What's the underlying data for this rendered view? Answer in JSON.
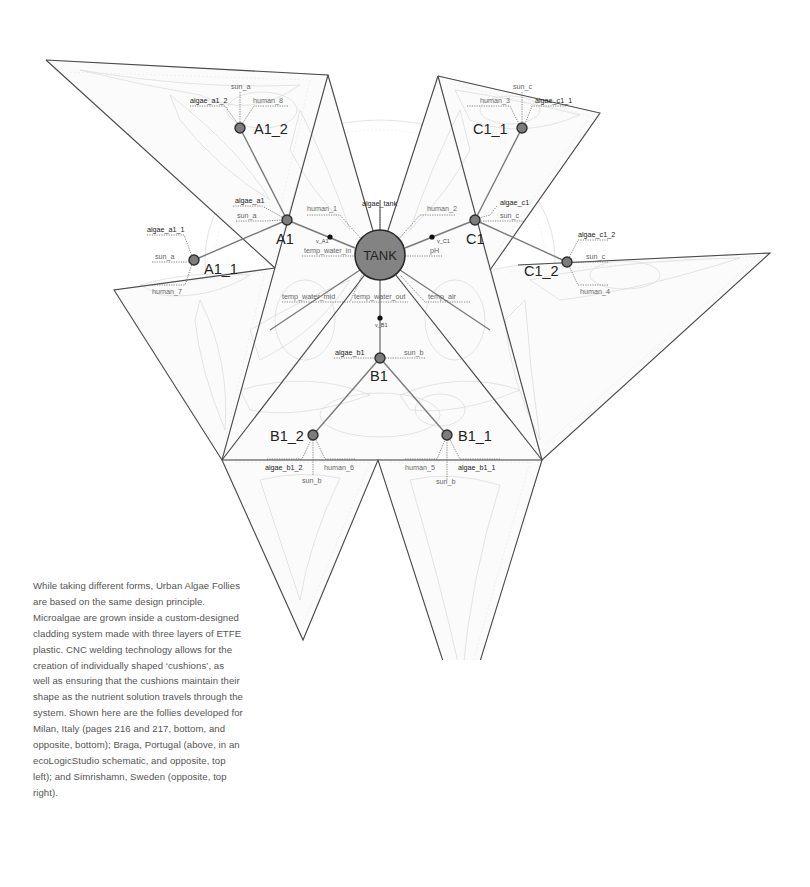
{
  "diagram": {
    "colors": {
      "node_fill": "#7c7c7c",
      "tank_fill": "#838383",
      "edge": "#4a4a4a",
      "background": "#ffffff"
    },
    "tank": {
      "label": "TANK"
    },
    "nodes": {
      "A1": "A1",
      "A1_1": "A1_1",
      "A1_2": "A1_2",
      "B1": "B1",
      "B1_1": "B1_1",
      "B1_2": "B1_2",
      "C1": "C1",
      "C1_1": "C1_1",
      "C1_2": "C1_2"
    },
    "valves": {
      "v_A1": "v_A1",
      "v_B1": "v_B1",
      "v_C1": "v_C1"
    },
    "sensors": {
      "algae_tank": "algae_tank",
      "human_1": "human_1",
      "human_2": "human_2",
      "temp_water_in": "temp_water_in",
      "pH": "pH",
      "temp_water_mid": "temp_water_mid",
      "temp_water_out": "temp_water_out",
      "temp_air": "temp_air",
      "algae_a1": "algae_a1",
      "sun_a_a1": "sun_a",
      "algae_a1_1": "algae_a1_1",
      "sun_a_a1_1": "sun_a",
      "human_7": "human_7",
      "algae_a1_2": "algae_a1_2",
      "sun_a_a1_2": "sun_a",
      "human_8": "human_8",
      "algae_c1": "algae_c1",
      "sun_c_c1": "sun_c",
      "algae_c1_1": "algae_c1_1",
      "sun_c_c1_1": "sun_c",
      "human_3": "human_3",
      "algae_c1_2": "algae_c1_2",
      "sun_c_c1_2": "sun_c",
      "human_4": "human_4",
      "algae_b1": "algae_b1",
      "sun_b_b1": "sun_b",
      "algae_b1_1": "algae_b1_1",
      "sun_b_b1_1": "sun_b",
      "human_5": "human_5",
      "algae_b1_2": "algae_b1_2",
      "sun_b_b1_2": "sun_b",
      "human_6": "human_6"
    }
  },
  "caption": {
    "text": "While taking different forms, Urban Algae Follies are based on the same design principle. Microalgae are grown inside a custom-designed cladding system made with three layers of ETFE plastic. CNC welding technology allows for the creation of individually shaped ‘cushions’, as well as ensuring that the cushions maintain their shape as the nutrient solution travels through the system. Shown here are the follies developed for Milan, Italy (pages 216 and 217, bottom, and opposite, bottom); Braga, Portugal (above, in an ecoLogicStudio schematic, and opposite, top left); and Simrishamn, Sweden (opposite, top right)."
  }
}
